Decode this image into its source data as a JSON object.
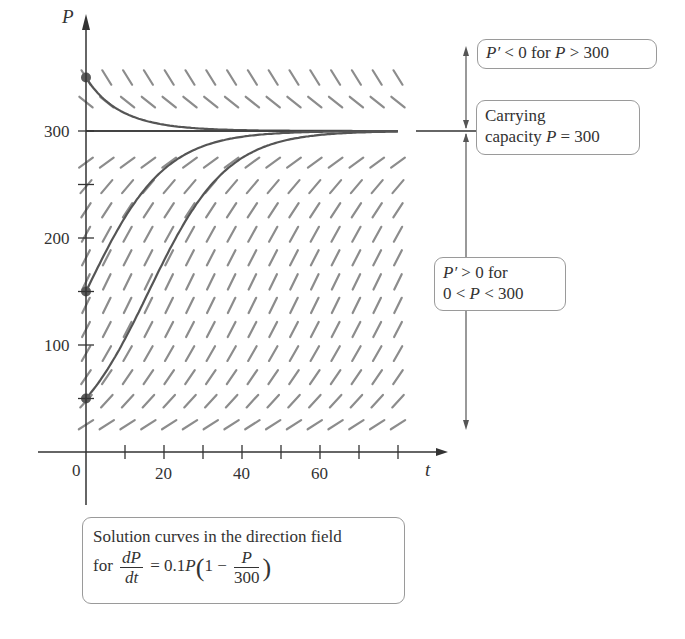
{
  "chart_data": {
    "type": "line",
    "equation": {
      "rate": 0.1,
      "carrying_capacity": 300
    },
    "xlabel": "t",
    "ylabel": "P",
    "xlim": [
      0,
      80
    ],
    "ylim": [
      0,
      370
    ],
    "x_ticks": [
      0,
      10,
      20,
      30,
      40,
      50,
      60,
      70,
      80
    ],
    "x_tick_labels": [
      "0",
      "20",
      "40",
      "60"
    ],
    "x_tick_label_values": [
      0,
      20,
      40,
      60
    ],
    "y_ticks": [
      50,
      100,
      150,
      200,
      250,
      300
    ],
    "y_tick_labels": [
      "100",
      "200",
      "300"
    ],
    "y_tick_label_values": [
      100,
      200,
      300
    ],
    "grid": false,
    "direction_field": {
      "t_columns": 16,
      "t_range": [
        0,
        80
      ],
      "P_rows": [
        25.5,
        47.5,
        70,
        92,
        114.5,
        137,
        159,
        181.5,
        203.5,
        226,
        248,
        270.5,
        327,
        350
      ]
    },
    "series": [
      {
        "name": "P(0)=350",
        "initial_value": 350,
        "t_end": 80
      },
      {
        "name": "P(0)=300 (equilibrium)",
        "initial_value": 300,
        "t_end": 80
      },
      {
        "name": "P(0)=150",
        "initial_value": 150,
        "t_end": 80
      },
      {
        "name": "P(0)=50",
        "initial_value": 50,
        "t_end": 80
      }
    ],
    "annotations": [
      "P' < 0 for P > 300",
      "Carrying capacity P = 300",
      "P' > 0 for 0 < P < 300"
    ]
  },
  "axes": {
    "y_label": "P",
    "x_label": "t",
    "y_ticks": [
      "300",
      "200",
      "100"
    ],
    "x_ticks": [
      "0",
      "20",
      "40",
      "60"
    ]
  },
  "callouts": {
    "decreasing": {
      "lhs": "P′",
      "rel": "< 0 for",
      "var": "P",
      "rhs": "> 300"
    },
    "capacity": {
      "line1": "Carrying",
      "line2_text": "capacity",
      "var": "P",
      "rhs": "= 300"
    },
    "increasing": {
      "line1_lhs": "P′",
      "line1_rest": "> 0 for",
      "line2_a": "0 <",
      "line2_var": "P",
      "line2_b": "< 300"
    }
  },
  "caption": {
    "line1": "Solution curves in the direction field",
    "for": "for",
    "frac_num": "dP",
    "frac_den": "dt",
    "rhs_a": "= 0.1",
    "rhs_var": "P",
    "paren_open": "(",
    "one_minus": "1 −",
    "inner_num": "P",
    "inner_den": "300",
    "paren_close": ")"
  },
  "colors": {
    "axis": "#333333",
    "curve": "#555555",
    "field": "#8c8c8c",
    "dot": "#5a5a5a"
  }
}
